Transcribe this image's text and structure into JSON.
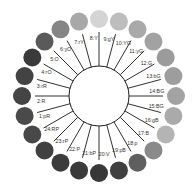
{
  "diagram": {
    "title": "",
    "center": {
      "x": 99,
      "y": 96
    },
    "inner_radius": 30,
    "spoke_outer_radius": 64,
    "swatch_orbit_radius": 77,
    "swatch_radius": 9,
    "label_radius": 58,
    "hues": [
      {
        "num": 1,
        "code": "pR",
        "label": "1:pR",
        "gray": "#4a4a4a"
      },
      {
        "num": 2,
        "code": "R",
        "label": "2:R",
        "gray": "#454545"
      },
      {
        "num": 3,
        "code": "rR",
        "label": "3:rR",
        "gray": "#434343"
      },
      {
        "num": 4,
        "code": "rO",
        "label": "4:rO",
        "gray": "#3a3a3a"
      },
      {
        "num": 5,
        "code": "O",
        "label": "5:O",
        "gray": "#5a5a5a"
      },
      {
        "num": 6,
        "code": "yO",
        "label": "6:yO",
        "gray": "#858585"
      },
      {
        "num": 7,
        "code": "rY",
        "label": "7:rY",
        "gray": "#a8a8a8"
      },
      {
        "num": 8,
        "code": "Y",
        "label": "8:Y",
        "gray": "#d4d4d4"
      },
      {
        "num": 9,
        "code": "gY",
        "label": "9:gY",
        "gray": "#bdbdbd"
      },
      {
        "num": 10,
        "code": "YG",
        "label": "10:YG",
        "gray": "#a9a9a9"
      },
      {
        "num": 11,
        "code": "yG",
        "label": "11:yG",
        "gray": "#a2a2a2"
      },
      {
        "num": 12,
        "code": "G",
        "label": "12:G",
        "gray": "#9b9b9b"
      },
      {
        "num": 13,
        "code": "bG",
        "label": "13:bG",
        "gray": "#9d9d9d"
      },
      {
        "num": 14,
        "code": "BG",
        "label": "14:BG",
        "gray": "#a3a3a3"
      },
      {
        "num": 15,
        "code": "BG",
        "label": "15:BG",
        "gray": "#aaaaaa"
      },
      {
        "num": 16,
        "code": "gB",
        "label": "16:gB",
        "gray": "#b4b4b4"
      },
      {
        "num": 17,
        "code": "B",
        "label": "17:B",
        "gray": "#8a8a8a"
      },
      {
        "num": 18,
        "code": "p",
        "label": "18:p",
        "gray": "#5f5f5f"
      },
      {
        "num": 19,
        "code": "pB",
        "label": "19:pB",
        "gray": "#3f3f3f"
      },
      {
        "num": 20,
        "code": "V",
        "label": "20:V",
        "gray": "#383838"
      },
      {
        "num": 21,
        "code": "bP",
        "label": "21:bP",
        "gray": "#3a3a3a"
      },
      {
        "num": 22,
        "code": "P",
        "label": "22:P",
        "gray": "#3c3c3c"
      },
      {
        "num": 23,
        "code": "rP",
        "label": "23:rP",
        "gray": "#404040"
      },
      {
        "num": 24,
        "code": "RP",
        "label": "24:RP",
        "gray": "#484848"
      }
    ],
    "colors": {
      "spoke": "#1a1a1a",
      "inner_circle_stroke": "#1a1a1a",
      "inner_circle_fill": "#ffffff",
      "label": "#333333",
      "background": "#ffffff"
    }
  }
}
